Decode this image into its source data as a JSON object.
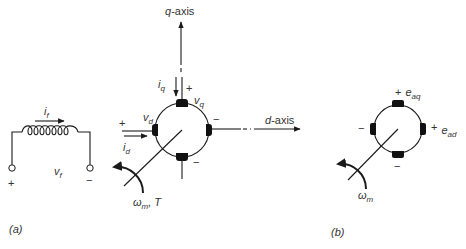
{
  "panel_a": {
    "caption": "(a)",
    "field_winding": {
      "current": {
        "main": "i",
        "sub": "f"
      },
      "voltage": {
        "main": "v",
        "sub": "f"
      },
      "plus": "+",
      "minus": "−"
    },
    "q_axis": {
      "var": "q",
      "suffix": "-axis"
    },
    "d_axis": {
      "var": "d",
      "suffix": "-axis"
    },
    "quadrature": {
      "current": {
        "main": "i",
        "sub": "q"
      },
      "voltage": {
        "main": "v",
        "sub": "q"
      },
      "plus": "+"
    },
    "direct": {
      "current": {
        "main": "i",
        "sub": "d"
      },
      "voltage": {
        "main": "v",
        "sub": "d"
      },
      "plus": "+"
    },
    "right_brush_sign": "−",
    "bottom_brush_sign": "−",
    "rotation": {
      "main": "ω",
      "sub": "m",
      "suffix": ", T"
    }
  },
  "panel_b": {
    "caption": "(b)",
    "eaq": {
      "plus": "+",
      "main": "e",
      "sub": "aq"
    },
    "ead": {
      "plus": "+",
      "main": "e",
      "sub": "ad"
    },
    "left_brush_sign": "−",
    "bottom_brush_sign": "−",
    "rotation": {
      "main": "ω",
      "sub": "m"
    }
  }
}
